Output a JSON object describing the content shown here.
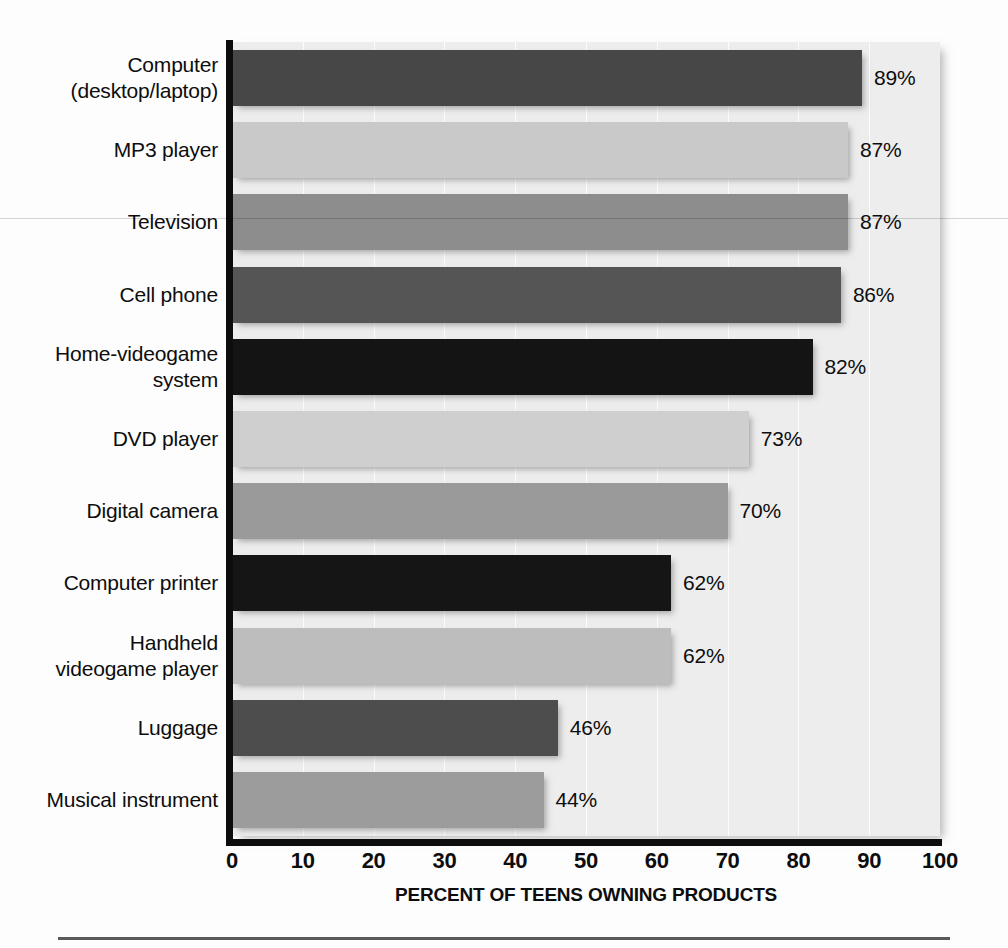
{
  "chart_data": {
    "type": "bar",
    "orientation": "horizontal",
    "title": "",
    "xlabel": "PERCENT OF TEENS OWNING PRODUCTS",
    "ylabel": "",
    "xlim": [
      0,
      100
    ],
    "xticks": [
      0,
      10,
      20,
      30,
      40,
      50,
      60,
      70,
      80,
      90,
      100
    ],
    "xtick_labels": [
      "0",
      "10",
      "20",
      "30",
      "40",
      "50",
      "60",
      "70",
      "80",
      "90",
      "100"
    ],
    "grid": true,
    "legend": "none",
    "value_suffix": "%",
    "categories": [
      "Computer\n(desktop/laptop)",
      "MP3 player",
      "Television",
      "Cell phone",
      "Home-videogame\nsystem",
      "DVD player",
      "Digital camera",
      "Computer printer",
      "Handheld\nvideogame player",
      "Luggage",
      "Musical instrument"
    ],
    "values": [
      89,
      87,
      87,
      86,
      82,
      73,
      70,
      62,
      62,
      46,
      44
    ],
    "value_labels": [
      "89%",
      "87%",
      "87%",
      "86%",
      "82%",
      "73%",
      "70%",
      "62%",
      "62%",
      "46%",
      "44%"
    ],
    "bar_colors": [
      "#474747",
      "#c9c9c9",
      "#8d8d8d",
      "#555555",
      "#141414",
      "#cfcfcf",
      "#9a9a9a",
      "#151515",
      "#bdbdbd",
      "#4d4d4d",
      "#9c9c9c"
    ],
    "plot_background": "#ededed",
    "axis_color": "#0d0d0d"
  },
  "colors": {
    "page_background": "#fdfdfd",
    "text": "#0d0d0d",
    "rule": "#5a5a5a"
  }
}
